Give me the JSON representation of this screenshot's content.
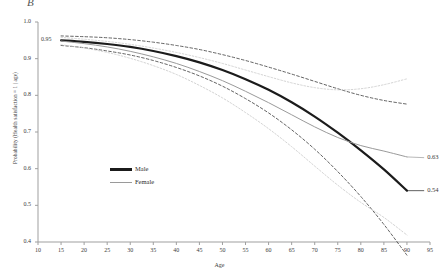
{
  "panel": {
    "label": "B"
  },
  "chart_data": {
    "type": "line",
    "title": "",
    "subtitle": "",
    "xlabel": "Age",
    "ylabel": "Probability (Health satisfaction = 1 | age)",
    "xlim": [
      10,
      95
    ],
    "ylim": [
      0.4,
      1.0
    ],
    "grid": false,
    "legend_position": "inside-left",
    "xticks": [
      10,
      15,
      20,
      25,
      30,
      35,
      40,
      45,
      50,
      55,
      60,
      65,
      70,
      75,
      80,
      85,
      90,
      95
    ],
    "xtick_labels": [
      "10",
      "15",
      "20",
      "25",
      "30",
      "35",
      "40",
      "45",
      "50",
      "55",
      "60",
      "65",
      "70",
      "75",
      "80",
      "85",
      "90",
      "95"
    ],
    "yticks": [
      0.4,
      0.5,
      0.6,
      0.7,
      0.8,
      0.9,
      1.0
    ],
    "ytick_labels": [
      "0.4",
      "0.5",
      "0.6",
      "0.7",
      "0.8",
      "0.9",
      "1.0"
    ],
    "extra_ytick": {
      "value": 0.95,
      "label": "0.95"
    },
    "annotations": [
      {
        "text": "0.63",
        "x": 92,
        "y": 0.63,
        "series": "Female"
      },
      {
        "text": "0.54",
        "x": 92,
        "y": 0.54,
        "series": "Male"
      }
    ],
    "x": [
      15,
      20,
      25,
      30,
      35,
      40,
      45,
      50,
      55,
      60,
      65,
      70,
      75,
      80,
      85,
      90
    ],
    "series": [
      {
        "name": "Male",
        "style": "solid-thick",
        "color": "#1b1b1b",
        "values": [
          0.95,
          0.946,
          0.94,
          0.932,
          0.921,
          0.907,
          0.89,
          0.869,
          0.844,
          0.815,
          0.781,
          0.742,
          0.698,
          0.65,
          0.598,
          0.54
        ],
        "ci_style": "dashed",
        "ci_color": "#3c3c3c",
        "ci_upper": [
          0.962,
          0.96,
          0.957,
          0.952,
          0.945,
          0.936,
          0.925,
          0.911,
          0.895,
          0.877,
          0.858,
          0.838,
          0.818,
          0.8,
          0.786,
          0.776
        ],
        "ci_lower": [
          0.936,
          0.93,
          0.921,
          0.91,
          0.895,
          0.876,
          0.853,
          0.825,
          0.791,
          0.752,
          0.706,
          0.653,
          0.592,
          0.524,
          0.448,
          0.364
        ]
      },
      {
        "name": "Female",
        "style": "solid-thin",
        "color": "#9a9a9a",
        "values": [
          0.948,
          0.941,
          0.932,
          0.92,
          0.905,
          0.887,
          0.865,
          0.84,
          0.811,
          0.78,
          0.747,
          0.714,
          0.685,
          0.663,
          0.648,
          0.632
        ],
        "ci_style": "dotted",
        "ci_color": "#c8c8c8",
        "ci_upper": [
          0.958,
          0.953,
          0.947,
          0.939,
          0.929,
          0.917,
          0.903,
          0.887,
          0.869,
          0.851,
          0.834,
          0.821,
          0.815,
          0.818,
          0.829,
          0.845
        ],
        "ci_lower": [
          0.938,
          0.929,
          0.917,
          0.901,
          0.881,
          0.857,
          0.827,
          0.793,
          0.753,
          0.709,
          0.66,
          0.607,
          0.555,
          0.508,
          0.467,
          0.419
        ]
      }
    ]
  },
  "legend": {
    "entries": [
      {
        "label": "Male"
      },
      {
        "label": "Female"
      }
    ]
  }
}
